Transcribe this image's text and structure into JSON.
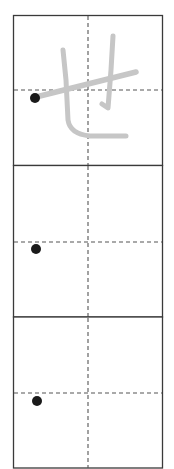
{
  "practice_sheet": {
    "character": "せ",
    "colors": {
      "border": "#3a3a3a",
      "guide": "#555555",
      "trace": "#c6c6c6",
      "start_dot": "#1a1a1a"
    },
    "cells": [
      {
        "index": 1,
        "has_trace": true,
        "guide_y": 90,
        "dot": {
          "x": 35,
          "y": 98
        }
      },
      {
        "index": 2,
        "has_trace": false,
        "guide_y": 242,
        "dot": {
          "x": 36,
          "y": 249
        }
      },
      {
        "index": 3,
        "has_trace": false,
        "guide_y": 393,
        "dot": {
          "x": 37,
          "y": 401
        }
      }
    ]
  }
}
